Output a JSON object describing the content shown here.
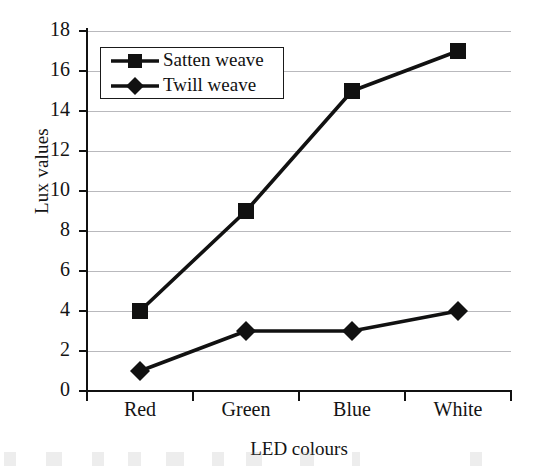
{
  "chart_data": {
    "type": "line",
    "title": "",
    "xlabel": "LED colours",
    "ylabel": "Lux values",
    "categories": [
      "Red",
      "Green",
      "Blue",
      "White"
    ],
    "series": [
      {
        "name": "Satten weave",
        "marker": "square",
        "values": [
          4,
          9,
          15,
          17
        ]
      },
      {
        "name": "Twill weave",
        "marker": "diamond",
        "values": [
          1,
          3,
          3,
          4
        ]
      }
    ],
    "ylim": [
      0,
      18
    ],
    "ytick_step": 2,
    "yticks": [
      0,
      2,
      4,
      6,
      8,
      10,
      12,
      14,
      16,
      18
    ],
    "grid": true,
    "grid_axis": "y",
    "legend_position": "top-left-inside",
    "line_color": "#111111",
    "grid_color": "#b9b9bd",
    "axis_color": "#111111",
    "background_color": "#ffffff"
  },
  "legend": {
    "entries": [
      {
        "label": "Satten weave",
        "marker_name": "square-marker-icon"
      },
      {
        "label": "Twill weave",
        "marker_name": "diamond-marker-icon"
      }
    ]
  },
  "axes": {
    "y_title": "Lux values",
    "x_title": "LED colours",
    "y_tick_labels": [
      "0",
      "2",
      "4",
      "6",
      "8",
      "10",
      "12",
      "14",
      "16",
      "18"
    ],
    "x_tick_labels": [
      "Red",
      "Green",
      "Blue",
      "White"
    ]
  }
}
